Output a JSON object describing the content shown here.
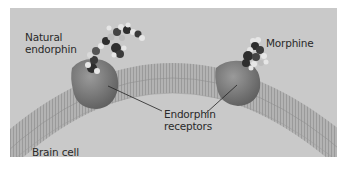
{
  "figure": {
    "labels": {
      "natural_endorphin_line1": "Natural",
      "natural_endorphin_line2": "endorphin",
      "morphine": "Morphine",
      "receptors_line1": "Endorphin",
      "receptors_line2": "receptors",
      "brain_cell": "Brain cell"
    },
    "colors": {
      "background": "#c9c9c9",
      "membrane": "#a8a8a8",
      "receptor": "#7a7a7a",
      "molecule_dark": "#2e2e2e",
      "molecule_light": "#e6e6e6"
    }
  }
}
